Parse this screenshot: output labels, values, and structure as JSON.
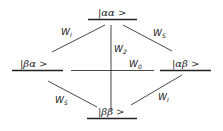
{
  "levels": {
    "top": "|αα >",
    "left": "|βα >",
    "right": "|αβ >",
    "bottom": "|ββ >"
  },
  "transitions": {
    "top_left": "W",
    "top_left_sub": "I",
    "top_right": "W",
    "top_right_sub": "S",
    "vertical": "W",
    "vertical_sub": "2",
    "horizontal": "W",
    "horizontal_sub": "0",
    "bottom_left": "W",
    "bottom_left_sub": "S",
    "bottom_right": "W",
    "bottom_right_sub": "I"
  }
}
